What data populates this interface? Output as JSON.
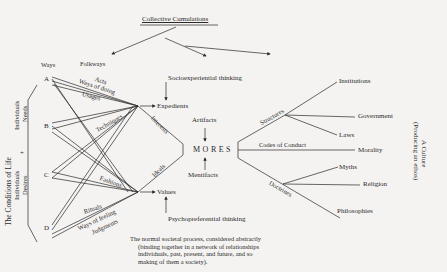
{
  "diagram": {
    "title": "Collective Cumulations",
    "left_bracket": {
      "main": "The Conditions of Life",
      "top": [
        "Individuals",
        "Needs"
      ],
      "plus": "+",
      "bottom": [
        "Individuals",
        "Desires"
      ]
    },
    "points": [
      "A",
      "B",
      "C",
      "D"
    ],
    "ways_label": "Ways",
    "folkways_label": "Folkways",
    "upper_fan_labels": [
      "Acts",
      "Ways of doing",
      "Usages",
      "Techniques"
    ],
    "lower_fan_labels": [
      "Fashions",
      "Rituals",
      "Ways of feeling",
      "Judgments"
    ],
    "expedients": "Expedients",
    "values": "Values",
    "interests": "Interests",
    "ideals": "Ideals",
    "socioexperiential": "Socioexperiential thinking",
    "psychopreferential": "Psychopreferential thinking",
    "artifacts": "Artifacts",
    "mentifacts": "Mentifacts",
    "mores": "MORES",
    "branches": {
      "structures": "Structures",
      "codes": "Codes of Conduct",
      "doctrines": "Doctrines"
    },
    "outcomes": [
      "Institutions",
      "Government",
      "Laws",
      "Morality",
      "Myths",
      "Religion",
      "Philosophies"
    ],
    "culture": [
      "A Culture",
      "(Producing an ethos)"
    ],
    "caption": [
      "The normal societal process, considered abstractly",
      "(binding together in a network of relationships",
      "individuals, past, present, and future, and so",
      "making of them a society)."
    ]
  }
}
